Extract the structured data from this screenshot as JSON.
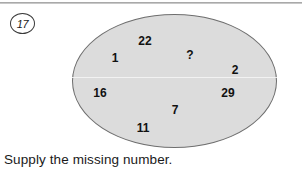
{
  "page": {
    "background_color": "#ffffff",
    "rule_color": "#a9a9a9"
  },
  "item_marker": {
    "label": "17"
  },
  "figure": {
    "shape": "ellipse",
    "fill_color": "#dcdcdc",
    "stroke_color": "#6e6e6e",
    "values": [
      {
        "text": "22",
        "x": 145,
        "y": 41
      },
      {
        "text": "1",
        "x": 115,
        "y": 58
      },
      {
        "text": "?",
        "x": 190,
        "y": 55
      },
      {
        "text": "2",
        "x": 235,
        "y": 70
      },
      {
        "text": "16",
        "x": 100,
        "y": 93
      },
      {
        "text": "29",
        "x": 228,
        "y": 93
      },
      {
        "text": "7",
        "x": 175,
        "y": 110
      },
      {
        "text": "11",
        "x": 143,
        "y": 128
      }
    ]
  },
  "caption": {
    "text": "Supply the missing number."
  }
}
